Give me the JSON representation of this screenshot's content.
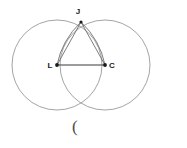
{
  "figure": {
    "background_color": "#ffffff",
    "circle_color": "#9a9a9a",
    "segment_color": "#6e6e6e",
    "base_color": "#3a3a3a",
    "label_color": "#1a1a1a",
    "width": 187,
    "height": 148
  },
  "points": {
    "apex": {
      "label": "J",
      "x": 81,
      "y": 22
    },
    "left_center": {
      "label": "L",
      "x": 57,
      "y": 65
    },
    "right_center": {
      "label": "C",
      "x": 105,
      "y": 65
    },
    "lower_intersection": {
      "label": "",
      "x": 81,
      "y": 107
    }
  },
  "circles": {
    "left": {
      "cx": 57,
      "cy": 65,
      "r": 45
    },
    "right": {
      "cx": 105,
      "cy": 65,
      "r": 45
    }
  },
  "segments": {
    "base": {
      "from": "L",
      "to": "C"
    },
    "left_side": {
      "from": "J",
      "to": "L"
    },
    "right_side": {
      "from": "J",
      "to": "C"
    },
    "left_inner": {
      "from": "J",
      "to": "L"
    },
    "right_inner": {
      "from": "J",
      "to": "C"
    }
  },
  "caption": {
    "text": "(",
    "x": 72,
    "y": 124
  }
}
